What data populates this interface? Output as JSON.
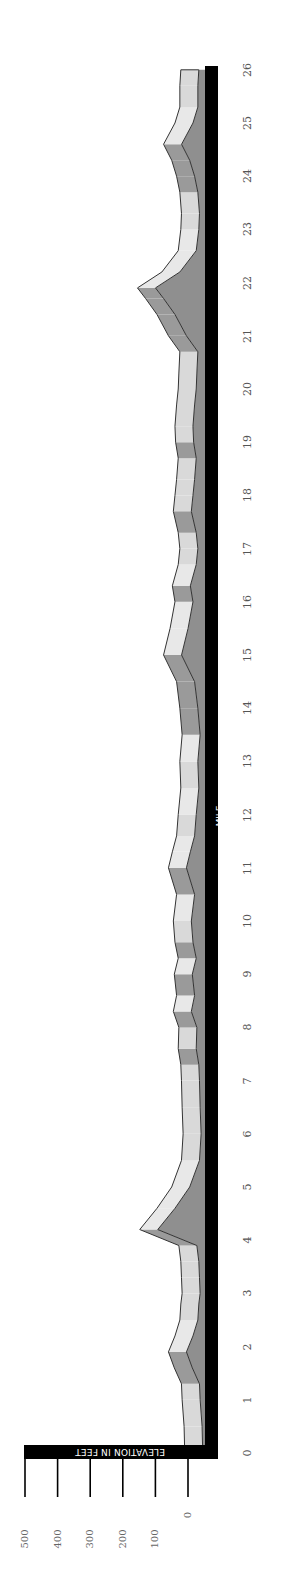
{
  "chart_data": {
    "type": "area",
    "orientation": "rotated-90-ccw",
    "title": "",
    "xlabel": "MILE",
    "ylabel": "ELEVATION IN FEET",
    "x_ticks": [
      0,
      1,
      2,
      3,
      4,
      5,
      6,
      7,
      8,
      9,
      10,
      11,
      12,
      13,
      14,
      15,
      16,
      17,
      18,
      19,
      20,
      21,
      22,
      23,
      24,
      25,
      26
    ],
    "y_ticks": [
      0,
      100,
      200,
      300,
      400,
      500
    ],
    "xlim": [
      0,
      26
    ],
    "ylim": [
      0,
      500
    ],
    "grid": false,
    "legend": null,
    "style": "3d-ribbon, grayscale",
    "series": [
      {
        "name": "Elevation",
        "x": [
          0,
          0.5,
          1,
          1.3,
          1.6,
          1.9,
          2.2,
          2.5,
          2.8,
          3,
          3.3,
          3.6,
          3.9,
          4.2,
          4.6,
          5,
          5.5,
          6,
          6.5,
          7,
          7.3,
          7.6,
          8,
          8.3,
          8.6,
          9,
          9.3,
          9.6,
          10,
          10.5,
          11,
          11.3,
          11.6,
          12,
          12.5,
          13,
          13.5,
          14,
          14.5,
          15,
          15.5,
          16,
          16.3,
          16.7,
          17,
          17.3,
          17.7,
          18,
          18.3,
          18.7,
          19,
          19.3,
          19.7,
          20,
          20.3,
          20.7,
          21,
          21.4,
          21.7,
          21.9,
          22.2,
          22.6,
          23,
          23.3,
          23.7,
          24,
          24.3,
          24.6,
          25,
          25.3,
          25.7,
          26
        ],
        "values": [
          10,
          12,
          18,
          20,
          42,
          60,
          40,
          25,
          22,
          18,
          20,
          22,
          28,
          148,
          95,
          50,
          20,
          15,
          18,
          20,
          22,
          30,
          28,
          45,
          35,
          42,
          30,
          40,
          45,
          35,
          60,
          48,
          35,
          30,
          22,
          25,
          18,
          25,
          35,
          75,
          55,
          40,
          48,
          30,
          25,
          30,
          45,
          40,
          35,
          30,
          38,
          40,
          35,
          30,
          28,
          25,
          60,
          95,
          130,
          155,
          80,
          30,
          22,
          20,
          25,
          35,
          50,
          75,
          40,
          25,
          25,
          22
        ]
      }
    ]
  },
  "labels": {
    "x_axis_title": "MILE",
    "y_axis_title": "ELEVATION IN FEET",
    "miles": [
      "0",
      "1",
      "2",
      "3",
      "4",
      "5",
      "6",
      "7",
      "8",
      "9",
      "10",
      "11",
      "12",
      "13",
      "14",
      "15",
      "16",
      "17",
      "18",
      "19",
      "20",
      "21",
      "22",
      "23",
      "24",
      "25",
      "26"
    ],
    "y_values": [
      "0",
      "100",
      "200",
      "300",
      "400",
      "500"
    ]
  },
  "colors": {
    "axis_bar": "#000000",
    "ribbon_top": "#e6e6e6",
    "ribbon_face": "#a8a8a8",
    "ribbon_side": "#8f8f8f",
    "outline": "#333333",
    "label": "#555555"
  }
}
